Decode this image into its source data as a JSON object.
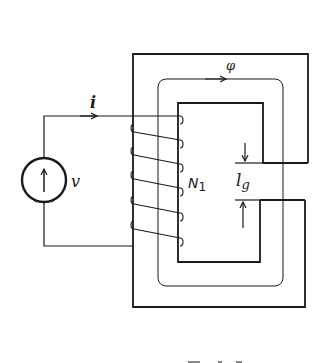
{
  "diagram": {
    "type": "magnetic-circuit",
    "labels": {
      "current": "i",
      "flux": "φ",
      "voltage": "v",
      "turns": "N",
      "turns_subscript": "1",
      "gap_length": "l",
      "gap_subscript": "g"
    },
    "components": [
      {
        "id": "voltage-source",
        "label": "v"
      },
      {
        "id": "coil",
        "label": "N1",
        "turns": 5
      },
      {
        "id": "core",
        "gap": true
      },
      {
        "id": "flux-path",
        "label": "φ"
      },
      {
        "id": "air-gap",
        "label": "lg"
      }
    ],
    "colors": {
      "line": "#1a1a1a",
      "background": "#ffffff"
    }
  }
}
